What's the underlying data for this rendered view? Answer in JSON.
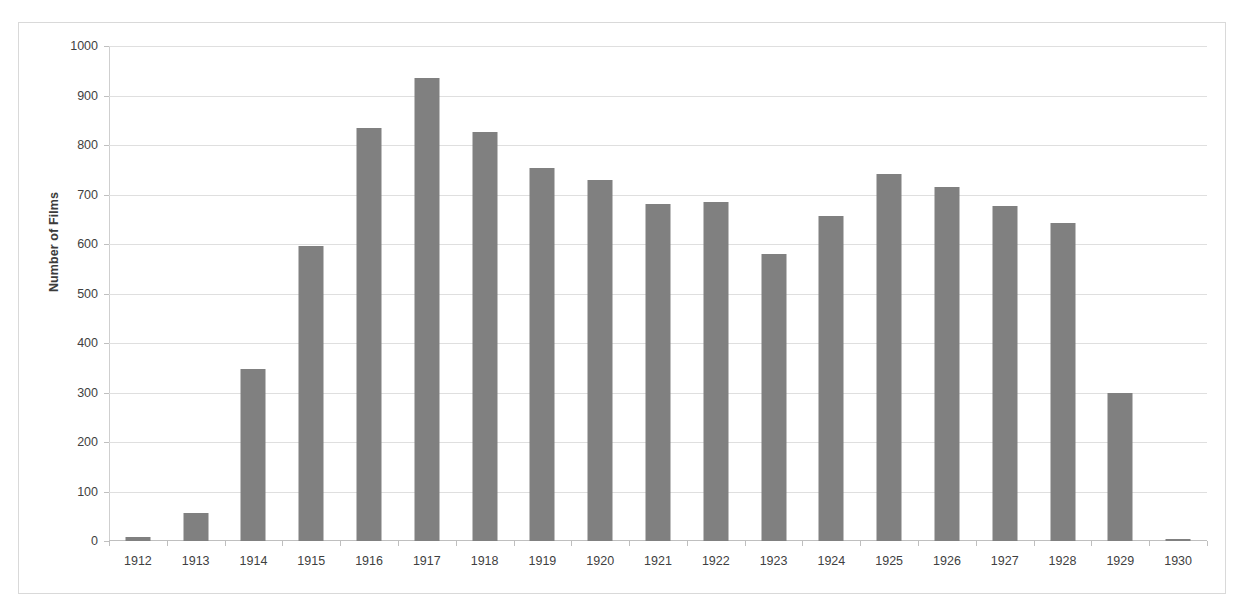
{
  "chart_data": {
    "type": "bar",
    "title": "",
    "xlabel": "",
    "ylabel": "Number of Films",
    "categories": [
      "1912",
      "1913",
      "1914",
      "1915",
      "1916",
      "1917",
      "1918",
      "1919",
      "1920",
      "1921",
      "1922",
      "1923",
      "1924",
      "1925",
      "1926",
      "1927",
      "1928",
      "1929",
      "1930"
    ],
    "values": [
      8,
      57,
      348,
      597,
      835,
      935,
      827,
      753,
      729,
      681,
      685,
      580,
      657,
      741,
      716,
      677,
      642,
      300,
      5
    ],
    "ylim": [
      0,
      1000
    ],
    "y_ticks": [
      0,
      100,
      200,
      300,
      400,
      500,
      600,
      700,
      800,
      900,
      1000
    ],
    "y_tick_labels": [
      "0",
      "100",
      "200",
      "300",
      "400",
      "500",
      "600",
      "700",
      "800",
      "900",
      "1000"
    ],
    "grid": true,
    "legend": false,
    "bar_color": "#808080",
    "gridline_color": "#dfdfdf",
    "axis_color": "#bfbfbf",
    "border_color": "#d9d9d9",
    "background": "#ffffff"
  }
}
